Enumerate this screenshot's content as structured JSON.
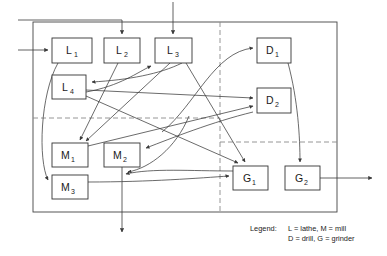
{
  "diagram": {
    "type": "flow-diagram",
    "canvas": {
      "width": 387,
      "height": 256
    },
    "frame": {
      "x": 33,
      "y": 22,
      "width": 304,
      "height": 190,
      "stroke": "#444444"
    },
    "cell_dividers": {
      "stroke": "#8a8a8a",
      "style": "dashed",
      "vertical": [
        {
          "x": 220,
          "y1": 22,
          "y2": 212
        }
      ],
      "horizontal": [
        {
          "y": 118,
          "x1": 33,
          "x2": 220
        },
        {
          "y": 142,
          "x1": 220,
          "x2": 337
        }
      ]
    },
    "machines": [
      {
        "id": "L1",
        "letter": "L",
        "sub": "1",
        "x": 52,
        "y": 38,
        "w": 40,
        "h": 25
      },
      {
        "id": "L2",
        "letter": "L",
        "sub": "2",
        "x": 104,
        "y": 38,
        "w": 36,
        "h": 25
      },
      {
        "id": "L3",
        "letter": "L",
        "sub": "3",
        "x": 155,
        "y": 38,
        "w": 37,
        "h": 25
      },
      {
        "id": "L4",
        "letter": "L",
        "sub": "4",
        "x": 52,
        "y": 75,
        "w": 34,
        "h": 24
      },
      {
        "id": "D1",
        "letter": "D",
        "sub": "1",
        "x": 257,
        "y": 38,
        "w": 34,
        "h": 25
      },
      {
        "id": "D2",
        "letter": "D",
        "sub": "2",
        "x": 257,
        "y": 88,
        "w": 34,
        "h": 25
      },
      {
        "id": "M1",
        "letter": "M",
        "sub": "1",
        "x": 52,
        "y": 143,
        "w": 36,
        "h": 24
      },
      {
        "id": "M2",
        "letter": "M",
        "sub": "2",
        "x": 104,
        "y": 143,
        "w": 36,
        "h": 24
      },
      {
        "id": "M3",
        "letter": "M",
        "sub": "3",
        "x": 52,
        "y": 175,
        "w": 36,
        "h": 24
      },
      {
        "id": "G1",
        "letter": "G",
        "sub": "1",
        "x": 233,
        "y": 166,
        "w": 35,
        "h": 24
      },
      {
        "id": "G2",
        "letter": "G",
        "sub": "2",
        "x": 285,
        "y": 166,
        "w": 35,
        "h": 24
      }
    ],
    "legend": {
      "label": "Legend:",
      "lines": [
        "L = lathe, M = mill",
        "D = drill, G = grinder"
      ]
    }
  }
}
